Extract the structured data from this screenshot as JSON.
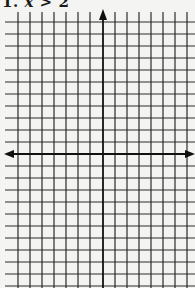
{
  "worksheet": {
    "problem": {
      "number": "1.",
      "variable": "x",
      "operator": ">",
      "value": "2"
    }
  },
  "grid": {
    "line_color": "#2a2a2a",
    "axis_color": "#111111",
    "background": "#f4f4f2",
    "cell_size_px": 12,
    "vertical_lines_x": [
      18,
      30,
      42,
      54,
      66,
      78,
      90,
      115,
      127,
      139,
      151,
      163,
      175,
      187
    ],
    "horizontal_lines_y": [
      22,
      34,
      46,
      58,
      70,
      82,
      94,
      106,
      118,
      130,
      142,
      166,
      178,
      190,
      202,
      214,
      226,
      238,
      250,
      262,
      274,
      286
    ],
    "y_axis_x": 103,
    "x_axis_y": 154,
    "x_axis_arrows": "both",
    "y_axis_arrow": "up"
  }
}
